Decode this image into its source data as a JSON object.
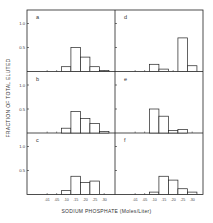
{
  "chart_data": {
    "type": "bar",
    "layout": "2x3 grid of histograms (small multiples), left column a,b,c; right column d,e,f",
    "xlabel": "SODIUM PHOSPHATE (Moles/Liter)",
    "ylabel": "FRACTION OF TOTAL ELUTED",
    "categories": [
      ".01",
      ".05",
      ".10",
      ".15",
      ".20",
      ".25",
      ".30"
    ],
    "y_ticks": [
      "0.5",
      "1.0"
    ],
    "ylim": [
      0,
      1.1
    ],
    "grid": false,
    "legend": null,
    "panels": [
      {
        "label": "a",
        "values": [
          0.0,
          0.0,
          0.1,
          0.5,
          0.3,
          0.1,
          0.02
        ]
      },
      {
        "label": "b",
        "values": [
          0.0,
          0.0,
          0.1,
          0.45,
          0.3,
          0.2,
          0.03
        ]
      },
      {
        "label": "c",
        "values": [
          0.0,
          0.0,
          0.08,
          0.38,
          0.25,
          0.28,
          0.0
        ]
      },
      {
        "label": "d",
        "values": [
          0.0,
          0.0,
          0.15,
          0.05,
          0.0,
          0.7,
          0.12
        ]
      },
      {
        "label": "e",
        "values": [
          0.0,
          0.0,
          0.5,
          0.35,
          0.05,
          0.07,
          0.0
        ]
      },
      {
        "label": "f",
        "values": [
          0.0,
          0.0,
          0.05,
          0.38,
          0.3,
          0.12,
          0.05
        ]
      }
    ]
  },
  "labels": {
    "ylabel": "FRACTION OF TOTAL ELUTED",
    "xlabel": "SODIUM PHOSPHATE (Moles/Liter)"
  }
}
